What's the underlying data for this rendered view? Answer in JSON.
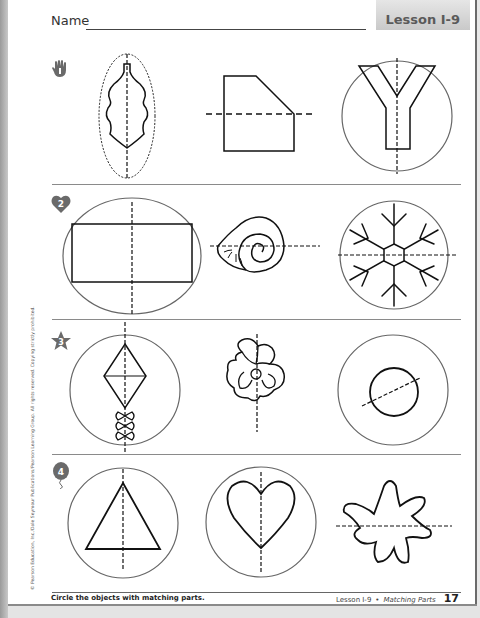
{
  "header": {
    "name_label": "Name",
    "lesson_tab": "Lesson I-9"
  },
  "rows": [
    {
      "number": "1",
      "icon": "hand-icon",
      "items": [
        {
          "shape": "leaf",
          "symmetry_line": "vertical",
          "circled": "dotted-oval"
        },
        {
          "shape": "pentagon-cut-corner",
          "symmetry_line": "horizontal",
          "circled": "none"
        },
        {
          "shape": "letter-Y",
          "symmetry_line": "vertical",
          "circled": "circle"
        }
      ]
    },
    {
      "number": "2",
      "icon": "heart-icon",
      "items": [
        {
          "shape": "rectangle",
          "symmetry_line": "vertical",
          "circled": "circle"
        },
        {
          "shape": "snail-shell",
          "symmetry_line": "horizontal",
          "circled": "none"
        },
        {
          "shape": "snowflake",
          "symmetry_line": "horizontal",
          "circled": "circle"
        }
      ]
    },
    {
      "number": "3",
      "icon": "star-icon",
      "items": [
        {
          "shape": "kite",
          "symmetry_line": "vertical",
          "circled": "circle"
        },
        {
          "shape": "flower",
          "symmetry_line": "vertical",
          "circled": "none"
        },
        {
          "shape": "circle",
          "symmetry_line": "diagonal",
          "circled": "circle"
        }
      ]
    },
    {
      "number": "4",
      "icon": "balloon-icon",
      "items": [
        {
          "shape": "triangle",
          "symmetry_line": "vertical",
          "circled": "circle"
        },
        {
          "shape": "heart",
          "symmetry_line": "vertical",
          "circled": "circle"
        },
        {
          "shape": "splat",
          "symmetry_line": "horizontal",
          "circled": "none"
        }
      ]
    }
  ],
  "footer": {
    "instruction": "Circle the objects with matching parts.",
    "lesson": "Lesson I-9",
    "bullet": "•",
    "topic": "Matching Parts",
    "page_number": "17"
  },
  "copyright": "© Pearson Education, Inc./Dale Seymour Publications/Pearson Learning Group. All rights reserved. Copying strictly prohibited."
}
